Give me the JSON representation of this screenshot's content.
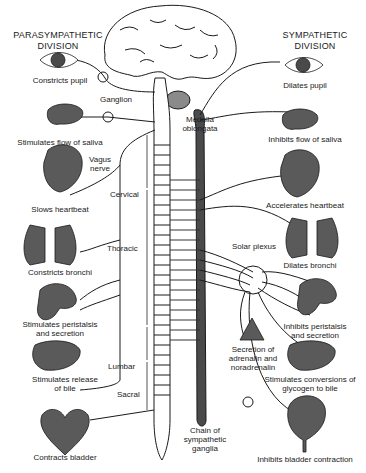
{
  "title_left": [
    "PARASYMPATHETIC",
    "DIVISION"
  ],
  "title_right": [
    "SYMPATHETIC",
    "DIVISION"
  ],
  "structures": {
    "ganglion": "Ganglion",
    "medulla": [
      "Medulla",
      "oblongata"
    ],
    "vagus": [
      "Vagus",
      "nerve"
    ],
    "cervical": "Cervical",
    "thoracic": "Thoracic",
    "lumbar": "Lumbar",
    "sacral": "Sacral",
    "solar_plexus": "Solar plexus",
    "chain": [
      "Chain of",
      "sympathetic",
      "ganglia"
    ]
  },
  "parasympathetic": [
    {
      "organ": "eye",
      "effect": [
        "Constricts pupil"
      ]
    },
    {
      "organ": "salivary-gland",
      "effect": [
        "Stimulates flow of saliva"
      ]
    },
    {
      "organ": "heart",
      "effect": [
        "Slows heartbeat"
      ]
    },
    {
      "organ": "lungs",
      "effect": [
        "Constricts bronchi"
      ]
    },
    {
      "organ": "stomach-intestines",
      "effect": [
        "Stimulates peristalsis",
        "and secretion"
      ]
    },
    {
      "organ": "liver",
      "effect": [
        "Stimulates release",
        "of bile"
      ]
    },
    {
      "organ": "bladder",
      "effect": [
        "Contracts bladder"
      ]
    }
  ],
  "sympathetic": [
    {
      "organ": "eye",
      "effect": [
        "Dilates pupil"
      ]
    },
    {
      "organ": "salivary-gland",
      "effect": [
        "Inhibits flow of saliva"
      ]
    },
    {
      "organ": "heart",
      "effect": [
        "Accelerates heartbeat"
      ]
    },
    {
      "organ": "lungs",
      "effect": [
        "Dilates bronchi"
      ]
    },
    {
      "organ": "stomach-intestines",
      "effect": [
        "Inhibits peristalsis",
        "and secretion"
      ]
    },
    {
      "organ": "adrenal-gland",
      "effect": [
        "Secretion of",
        "adrenalin and",
        "noradrenalin"
      ]
    },
    {
      "organ": "liver",
      "effect": [
        "Stimulates conversions of",
        "glycogen to bile"
      ]
    },
    {
      "organ": "bladder",
      "effect": [
        "Inhibits bladder contraction"
      ]
    }
  ],
  "colors": {
    "ink": "#1a1a1a",
    "organ_fill": "#5a5a5a",
    "chain_fill": "#4a4a4a",
    "paper": "#ffffff"
  }
}
